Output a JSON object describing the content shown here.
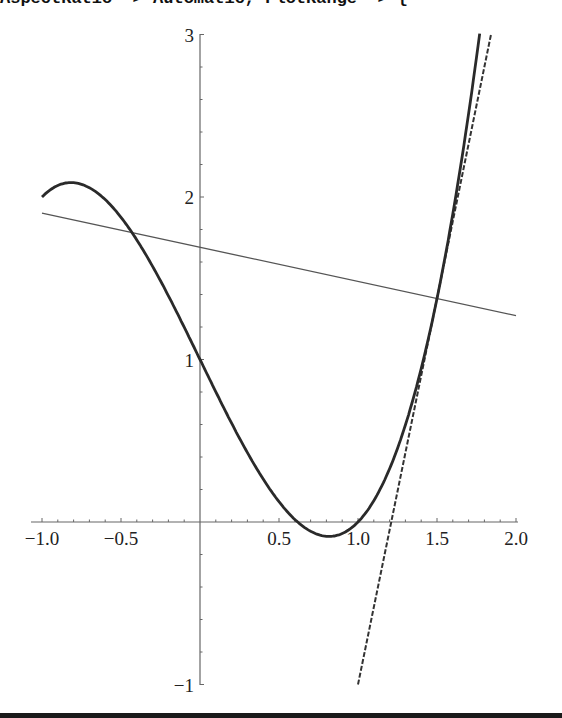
{
  "code_fragment": "AspectRatio -> Automatic, PlotRange -> {",
  "chart_data": {
    "type": "line",
    "title": "",
    "xlabel": "",
    "ylabel": "",
    "xlim": [
      -1.05,
      2.0
    ],
    "ylim": [
      -1,
      3
    ],
    "grid": false,
    "legend": null,
    "x_ticks": [
      "−1.0",
      "−0.5",
      "0.5",
      "1.0",
      "1.5",
      "2.0"
    ],
    "x_tick_values": [
      -1.0,
      -0.5,
      0.5,
      1.0,
      1.5,
      2.0
    ],
    "y_ticks": [
      "−1",
      "1",
      "2",
      "3"
    ],
    "y_tick_values": [
      -1,
      1,
      2,
      3
    ],
    "series": [
      {
        "name": "f(x) = x^3 - 2x + 1",
        "style": "solid-thick",
        "x": [
          -1.0,
          -0.8,
          -0.5,
          0.0,
          0.5,
          0.816,
          1.0,
          1.5,
          1.77
        ],
        "y": [
          2.0,
          2.088,
          1.875,
          1.0,
          0.125,
          -0.089,
          0.0,
          1.375,
          3.0
        ]
      },
      {
        "name": "tangent line at x=1.5: y = 1.375 + 4.75(x - 1.5)",
        "style": "dashed",
        "x": [
          1.0,
          1.842
        ],
        "y": [
          -1.0,
          3.0
        ]
      },
      {
        "name": "normal line at x=1.5: y = 1.375 - 0.2105(x - 1.5)",
        "style": "solid-thin",
        "x": [
          -1.0,
          2.0
        ],
        "y": [
          1.901,
          1.27
        ]
      }
    ],
    "annotations": []
  },
  "colors": {
    "curve": "#2a2a2a",
    "axis": "#555555",
    "background": "#ffffff"
  }
}
